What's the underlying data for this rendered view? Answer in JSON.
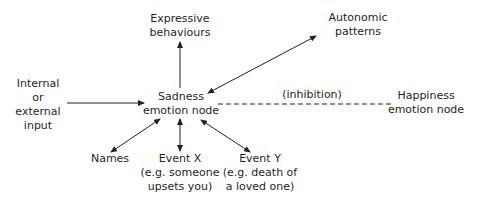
{
  "diagram": {
    "colors": {
      "text": "#231f20",
      "line": "#231f20",
      "background": "#ffffff"
    },
    "nodes": {
      "sadness": {
        "lines": [
          "Sadness",
          "emotion node"
        ]
      },
      "expressive": {
        "lines": [
          "Expressive",
          "behaviours"
        ]
      },
      "autonomic": {
        "lines": [
          "Autonomic",
          "patterns"
        ]
      },
      "input": {
        "lines": [
          "Internal",
          "or",
          "external",
          "input"
        ]
      },
      "happiness": {
        "lines": [
          "Happiness",
          "emotion node"
        ]
      },
      "names": {
        "lines": [
          "Names"
        ]
      },
      "event_x": {
        "lines": [
          "Event X",
          "(e.g. someone",
          "upsets you)"
        ]
      },
      "event_y": {
        "lines": [
          "Event Y",
          "(e.g. death of",
          "a loved one)"
        ]
      }
    },
    "edge_labels": {
      "inhibition": "(inhibition)"
    },
    "edges": [
      {
        "from": "sadness",
        "to": "expressive",
        "style": "arrow"
      },
      {
        "from": "sadness",
        "to": "autonomic",
        "style": "double-arrow"
      },
      {
        "from": "input",
        "to": "sadness",
        "style": "arrow"
      },
      {
        "from": "sadness",
        "to": "happiness",
        "style": "dashed",
        "label": "(inhibition)"
      },
      {
        "from": "sadness",
        "to": "names",
        "style": "double-arrow"
      },
      {
        "from": "sadness",
        "to": "event_x",
        "style": "double-arrow"
      },
      {
        "from": "sadness",
        "to": "event_y",
        "style": "double-arrow"
      }
    ]
  }
}
